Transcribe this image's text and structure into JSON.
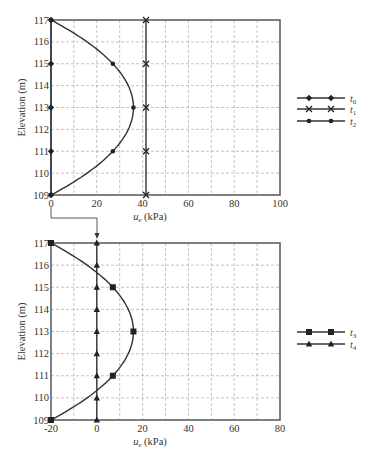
{
  "chart_data": [
    {
      "type": "line",
      "title": "",
      "xlabel": "u_e (kPa)",
      "ylabel": "Elevation (m)",
      "xlim": [
        0,
        100
      ],
      "ylim": [
        109,
        117
      ],
      "xticks": [
        "0",
        "20",
        "40",
        "60",
        "80",
        "100"
      ],
      "yticks": [
        "109",
        "110",
        "111",
        "112",
        "113",
        "114",
        "115",
        "116",
        "117"
      ],
      "grid": true,
      "legend_position": "right",
      "series": [
        {
          "name": "t0",
          "marker": "diamond",
          "x": [
            0,
            0,
            0,
            0,
            0
          ],
          "y": [
            109,
            111,
            113,
            115,
            117
          ]
        },
        {
          "name": "t1",
          "marker": "x",
          "x": [
            41.5,
            41.5,
            41.5,
            41.5,
            41.5
          ],
          "y": [
            109,
            111,
            113,
            115,
            117
          ]
        },
        {
          "name": "t2",
          "marker": "circle",
          "x": [
            0,
            27,
            36,
            27,
            0
          ],
          "y": [
            109,
            111,
            113,
            115,
            117
          ]
        }
      ]
    },
    {
      "type": "line",
      "title": "",
      "xlabel": "u_e (kPa)",
      "ylabel": "Elevation (m)",
      "xlim": [
        -20,
        80
      ],
      "ylim": [
        109,
        117
      ],
      "xticks": [
        "-20",
        "0",
        "20",
        "40",
        "60",
        "80"
      ],
      "yticks": [
        "109",
        "110",
        "111",
        "112",
        "113",
        "114",
        "115",
        "116",
        "117"
      ],
      "grid": true,
      "legend_position": "right",
      "series": [
        {
          "name": "t3",
          "marker": "square",
          "x": [
            -20,
            7,
            16,
            7,
            -20
          ],
          "y": [
            109,
            111,
            113,
            115,
            117
          ]
        },
        {
          "name": "t4",
          "marker": "triangle",
          "x": [
            0,
            0,
            0,
            0,
            0,
            0,
            0,
            0,
            0
          ],
          "y": [
            109,
            110,
            111,
            112,
            113,
            114,
            115,
            116,
            117
          ]
        }
      ]
    }
  ],
  "labels": {
    "ylabel": "Elevation (m)",
    "xlabel_main": "u",
    "xlabel_sub": "e",
    "xlabel_unit": " (kPa)",
    "legend_top": [
      {
        "main": "t",
        "sub": "0"
      },
      {
        "main": "t",
        "sub": "1"
      },
      {
        "main": "t",
        "sub": "2"
      }
    ],
    "legend_bottom": [
      {
        "main": "t",
        "sub": "3"
      },
      {
        "main": "t",
        "sub": "4"
      }
    ]
  }
}
